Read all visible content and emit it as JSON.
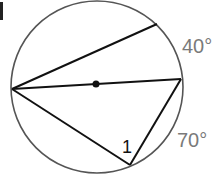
{
  "diagram": {
    "type": "circle-inscribed-angles",
    "arc_labels": {
      "upper_right": "40°",
      "lower_right": "70°"
    },
    "angle_label": "1",
    "colors": {
      "circle": "#555555",
      "lines": "#111111",
      "labels": "#7a7a7a",
      "angle_label": "#111111"
    }
  }
}
